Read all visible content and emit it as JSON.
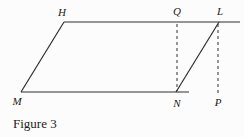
{
  "figure": {
    "caption": "Figure 3",
    "diagram": {
      "type": "geometry",
      "canvas": {
        "width": 244,
        "height": 137
      },
      "background": "#fcfcfc",
      "stroke_color": "#2e2e2e",
      "solid_lines": [
        {
          "name": "top-edge-HL-extended",
          "x1": 64,
          "y1": 22,
          "x2": 240,
          "y2": 22
        },
        {
          "name": "left-edge-HM",
          "x1": 64,
          "y1": 22,
          "x2": 21,
          "y2": 92
        },
        {
          "name": "bottom-edge-MN-extended",
          "x1": 21,
          "y1": 92,
          "x2": 189,
          "y2": 92
        },
        {
          "name": "edge-NL",
          "x1": 176,
          "y1": 92,
          "x2": 219,
          "y2": 22
        }
      ],
      "dashed_lines": [
        {
          "name": "dashed-height-QN",
          "x1": 177,
          "y1": 24,
          "x2": 177,
          "y2": 91
        },
        {
          "name": "dashed-height-LP",
          "x1": 218,
          "y1": 24,
          "x2": 218,
          "y2": 95
        }
      ],
      "labels": [
        {
          "text": "H",
          "x": 62,
          "y": 16
        },
        {
          "text": "Q",
          "x": 177,
          "y": 15
        },
        {
          "text": "L",
          "x": 220,
          "y": 15
        },
        {
          "text": "M",
          "x": 17,
          "y": 105
        },
        {
          "text": "N",
          "x": 177,
          "y": 107
        },
        {
          "text": "P",
          "x": 218,
          "y": 106
        }
      ]
    }
  }
}
